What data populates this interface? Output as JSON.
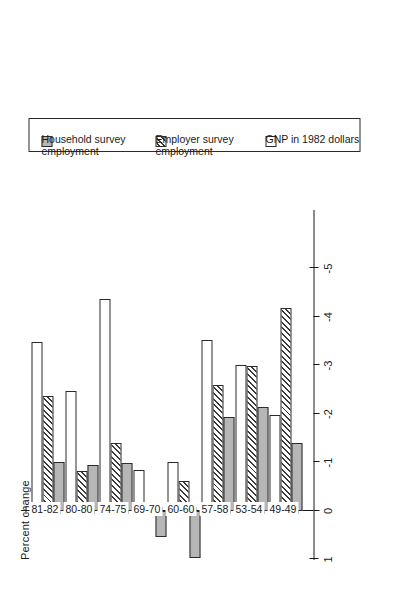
{
  "figure": {
    "axis_title": "Percent change"
  },
  "chart_data": {
    "type": "bar",
    "title": "",
    "subtitle": "",
    "orientation": "horizontal-rotated",
    "xlabel": "",
    "ylabel": "Percent change",
    "ylim": [
      1,
      -5
    ],
    "grid": false,
    "legend_position": "right",
    "categories": [
      "49-49",
      "53-54",
      "57-58",
      "60-60",
      "69-70",
      "74-75",
      "80-80",
      "81-82"
    ],
    "tick_labels": [
      "1",
      "0",
      "-1",
      "-2",
      "-3",
      "-4",
      "-5"
    ],
    "tick_values": [
      1,
      0,
      -1,
      -2,
      -3,
      -4,
      -5
    ],
    "series": [
      {
        "name": "Household survey employment",
        "label_lines": [
          "Household survey",
          "employment"
        ],
        "fill": "solid-gray",
        "color": "#b6b6b6",
        "values": [
          -1.4,
          -2.14,
          -1.94,
          0.97,
          0.53,
          -0.99,
          -0.95,
          -1.02
        ]
      },
      {
        "name": "Employer survey employment",
        "label_lines": [
          "Employer survey",
          "employment"
        ],
        "fill": "diagonal-hatch",
        "color": "#3a3a3a",
        "values": [
          -4.18,
          -2.98,
          -2.6,
          -0.62,
          -0.13,
          -1.4,
          -0.82,
          -2.38
        ]
      },
      {
        "name": "GNP in 1982 dollars",
        "label_lines": [
          "GNP in 1982 dollars"
        ],
        "fill": "white",
        "color": "#ffffff",
        "values": [
          -1.98,
          -3.02,
          -3.52,
          -1.02,
          -0.85,
          -4.38,
          -2.48,
          -3.48
        ]
      }
    ]
  },
  "legend": {
    "entries": [
      {
        "name": "Household survey employment",
        "line1": "Household survey",
        "line2": "employment",
        "swatch": "household"
      },
      {
        "name": "Employer survey employment",
        "line1": "Employer survey",
        "line2": "employment",
        "swatch": "employer"
      },
      {
        "name": "GNP in 1982 dollars",
        "line1": "GNP in 1982 dollars",
        "line2": "",
        "swatch": "gnp"
      }
    ]
  }
}
